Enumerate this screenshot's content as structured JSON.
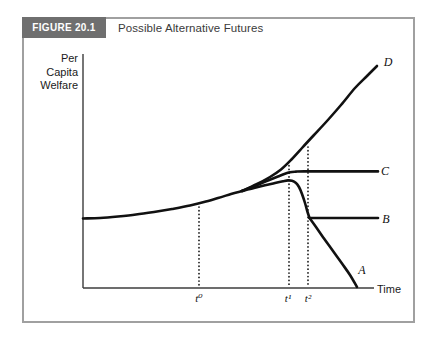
{
  "figure_header": {
    "label": "FIGURE 20.1",
    "title": "Possible Alternative Futures"
  },
  "axes_labels": {
    "y_label": "Per\nCapita\nWelfare",
    "x_label": "Time"
  },
  "colors": {
    "curve": "#111111",
    "axis": "#3c3c3c",
    "guide_dots": "#111111",
    "border": "#a0a0a0",
    "header_box": "#6f6f6f",
    "header_text": "#ffffff",
    "title_text": "#3a3a3a"
  },
  "chart_data": {
    "type": "line",
    "title": "Possible Alternative Futures",
    "xlabel": "Time",
    "ylabel": "Per Capita Welfare",
    "axes_numeric": false,
    "x_tick_labels": [
      "t⁰",
      "t¹",
      "t²"
    ],
    "legend": "none (curves labeled A, B, C, D at line ends)",
    "axes_px": {
      "y_axis": {
        "x": 83,
        "y1": 54,
        "y2": 288
      },
      "x_axis": {
        "y": 288,
        "x1": 83,
        "x2": 374
      }
    },
    "series": [
      {
        "name": "common-path",
        "points": [
          [
            83,
            218.5
          ],
          [
            100,
            218
          ],
          [
            118,
            216.5
          ],
          [
            136,
            214.5
          ],
          [
            154,
            212
          ],
          [
            172,
            209
          ],
          [
            190,
            205.5
          ],
          [
            204,
            202
          ],
          [
            218,
            198
          ],
          [
            231,
            194
          ],
          [
            242,
            191
          ]
        ]
      },
      {
        "name": "D",
        "points": [
          [
            242,
            191
          ],
          [
            256,
            184.5
          ],
          [
            270,
            177
          ],
          [
            281,
            169.5
          ],
          [
            291,
            160
          ],
          [
            302,
            148
          ],
          [
            314,
            135
          ],
          [
            327,
            121
          ],
          [
            341,
            105
          ],
          [
            355,
            88
          ],
          [
            367,
            76
          ],
          [
            377,
            66
          ]
        ]
      },
      {
        "name": "C",
        "points": [
          [
            242,
            191
          ],
          [
            256,
            185.5
          ],
          [
            268,
            180.5
          ],
          [
            278,
            176.5
          ],
          [
            285,
            173.8
          ],
          [
            290,
            172.3
          ],
          [
            296,
            171.6
          ],
          [
            304,
            171.4
          ],
          [
            340,
            171.4
          ],
          [
            378,
            171.4
          ]
        ]
      },
      {
        "name": "AB-peak",
        "points": [
          [
            242,
            191
          ],
          [
            254,
            188
          ],
          [
            265,
            185.3
          ],
          [
            275,
            182.9
          ],
          [
            283,
            181.2
          ],
          [
            288,
            180.4
          ],
          [
            292,
            180.8
          ],
          [
            296,
            183
          ],
          [
            299,
            187
          ],
          [
            302,
            194
          ],
          [
            305,
            203
          ],
          [
            307.5,
            212
          ],
          [
            309.5,
            218
          ]
        ]
      },
      {
        "name": "B",
        "points": [
          [
            309.5,
            218
          ],
          [
            378,
            218
          ]
        ]
      },
      {
        "name": "A",
        "points": [
          [
            309.5,
            218
          ],
          [
            316,
            227
          ],
          [
            324,
            238.5
          ],
          [
            333,
            251
          ],
          [
            342,
            263.5
          ],
          [
            350,
            275
          ],
          [
            357,
            287
          ]
        ]
      }
    ],
    "guides": [
      {
        "name": "t0",
        "x": 199,
        "y1": 207,
        "y2": 286
      },
      {
        "name": "t1",
        "x": 289,
        "y1": 162,
        "y2": 286
      },
      {
        "name": "t2",
        "x": 308,
        "y1": 147,
        "y2": 286
      }
    ],
    "curve_labels": [
      {
        "label": "D",
        "x": 388,
        "y": 62
      },
      {
        "label": "C",
        "x": 385,
        "y": 171
      },
      {
        "label": "B",
        "x": 386,
        "y": 219
      },
      {
        "label": "A",
        "x": 362,
        "y": 270
      }
    ],
    "tick_labels": [
      {
        "label": "t⁰",
        "x": 199
      },
      {
        "label": "t¹",
        "x": 288
      },
      {
        "label": "t²",
        "x": 308
      }
    ]
  }
}
